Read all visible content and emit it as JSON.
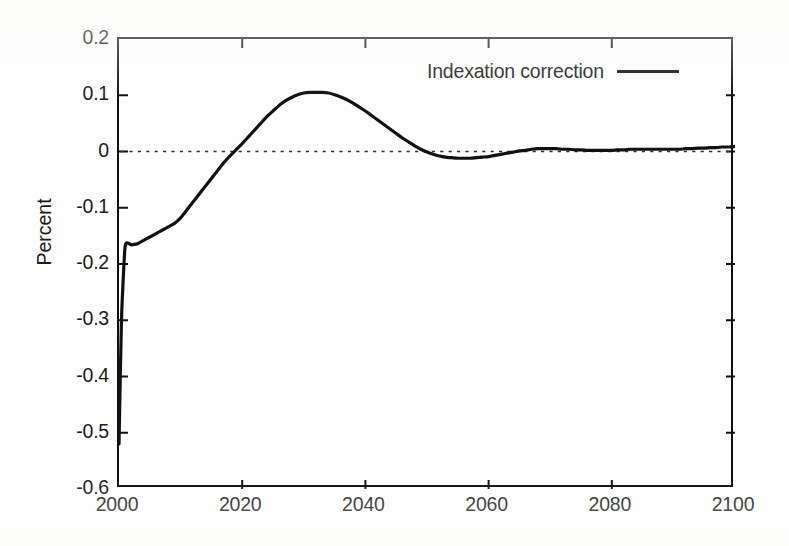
{
  "figure": {
    "background_color": "#fefefe",
    "ink_color": "#111111"
  },
  "axis_titles": {
    "ylabel": "Percent",
    "xlabel": ""
  },
  "legend": {
    "entries": [
      {
        "label": "Indexation correction",
        "style": "solid-line",
        "color": "#111111"
      }
    ]
  },
  "yticks": [
    {
      "value": 0.2,
      "label": "0.2"
    },
    {
      "value": 0.1,
      "label": "0.1"
    },
    {
      "value": 0.0,
      "label": "0"
    },
    {
      "value": -0.1,
      "label": "-0.1"
    },
    {
      "value": -0.2,
      "label": "-0.2"
    },
    {
      "value": -0.3,
      "label": "-0.3"
    },
    {
      "value": -0.4,
      "label": "-0.4"
    },
    {
      "value": -0.5,
      "label": "-0.5"
    },
    {
      "value": -0.6,
      "label": "-0.6"
    }
  ],
  "xticks": [
    {
      "value": 2000,
      "label": "2000"
    },
    {
      "value": 2020,
      "label": "2020"
    },
    {
      "value": 2040,
      "label": "2040"
    },
    {
      "value": 2060,
      "label": "2060"
    },
    {
      "value": 2080,
      "label": "2080"
    },
    {
      "value": 2100,
      "label": "2100"
    }
  ],
  "reference_line": {
    "value": 0,
    "style": "dotted",
    "color": "#333333"
  },
  "chart_data": {
    "type": "line",
    "title": "",
    "subtitle": "",
    "xlabel": "",
    "ylabel": "Percent",
    "xlim": [
      2000,
      2100
    ],
    "ylim": [
      -0.6,
      0.2
    ],
    "grid": false,
    "legend_position": "top-right-inside",
    "annotations": [
      {
        "text": "zero reference line",
        "y": 0,
        "style": "dotted"
      }
    ],
    "series": [
      {
        "name": "Indexation correction",
        "color": "#111111",
        "linestyle": "solid",
        "linewidth": 3.2,
        "x": [
          2000,
          2000.4,
          2001,
          2002,
          2003,
          2004,
          2005,
          2006,
          2007,
          2008,
          2009,
          2010,
          2011,
          2012,
          2013,
          2014,
          2015,
          2016,
          2017,
          2018,
          2019,
          2020,
          2021,
          2022,
          2023,
          2024,
          2025,
          2026,
          2027,
          2028,
          2029,
          2030,
          2031,
          2032,
          2033,
          2034,
          2035,
          2036,
          2037,
          2038,
          2039,
          2040,
          2041,
          2042,
          2043,
          2044,
          2045,
          2046,
          2047,
          2048,
          2049,
          2050,
          2051,
          2052,
          2053,
          2054,
          2055,
          2056,
          2057,
          2058,
          2059,
          2060,
          2061,
          2062,
          2063,
          2064,
          2065,
          2066,
          2067,
          2068,
          2069,
          2070,
          2071,
          2072,
          2073,
          2074,
          2075,
          2076,
          2077,
          2078,
          2079,
          2080,
          2081,
          2082,
          2083,
          2084,
          2085,
          2086,
          2087,
          2088,
          2089,
          2090,
          2091,
          2092,
          2093,
          2094,
          2095,
          2096,
          2097,
          2098,
          2099,
          2100
        ],
        "y": [
          -0.52,
          -0.3,
          -0.168,
          -0.166,
          -0.164,
          -0.158,
          -0.152,
          -0.146,
          -0.14,
          -0.134,
          -0.128,
          -0.118,
          -0.104,
          -0.09,
          -0.076,
          -0.062,
          -0.048,
          -0.034,
          -0.02,
          -0.008,
          0.003,
          0.014,
          0.026,
          0.038,
          0.05,
          0.062,
          0.072,
          0.082,
          0.09,
          0.096,
          0.101,
          0.104,
          0.105,
          0.105,
          0.105,
          0.104,
          0.101,
          0.097,
          0.092,
          0.086,
          0.079,
          0.072,
          0.064,
          0.056,
          0.048,
          0.04,
          0.032,
          0.024,
          0.017,
          0.01,
          0.004,
          -0.001,
          -0.005,
          -0.008,
          -0.01,
          -0.011,
          -0.012,
          -0.012,
          -0.012,
          -0.011,
          -0.01,
          -0.009,
          -0.007,
          -0.005,
          -0.003,
          -0.001,
          0.001,
          0.002,
          0.004,
          0.005,
          0.005,
          0.005,
          0.005,
          0.004,
          0.004,
          0.003,
          0.003,
          0.002,
          0.002,
          0.002,
          0.002,
          0.002,
          0.003,
          0.003,
          0.004,
          0.004,
          0.004,
          0.004,
          0.004,
          0.004,
          0.004,
          0.004,
          0.004,
          0.005,
          0.005,
          0.006,
          0.006,
          0.007,
          0.007,
          0.008,
          0.008,
          0.009
        ]
      }
    ],
    "key_features": {
      "start_value_2000": -0.52,
      "early_plateau_value": -0.165,
      "first_zero_crossing_year": 2019,
      "peak_value": 0.105,
      "peak_year_range": [
        2031,
        2034
      ],
      "second_zero_crossing_year": 2050,
      "trough_value": -0.012,
      "trough_year_range": [
        2055,
        2058
      ],
      "end_value_2100": 0.009
    }
  }
}
